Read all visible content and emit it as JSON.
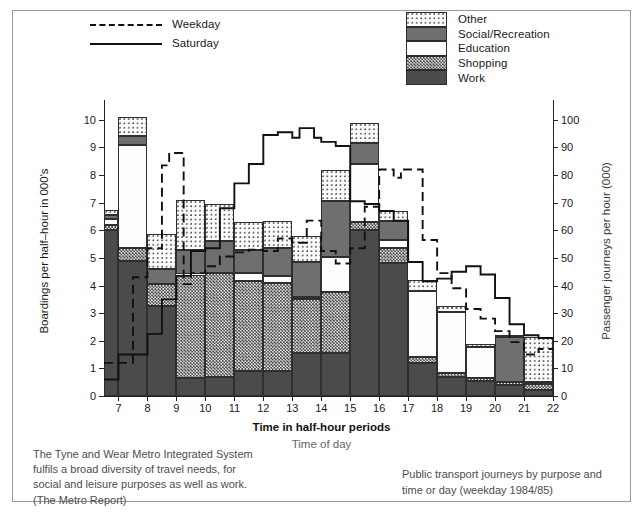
{
  "day_legend": [
    {
      "name": "Weekday",
      "style": "dashed"
    },
    {
      "name": "Saturday",
      "style": "solid"
    }
  ],
  "category_legend": [
    {
      "label": "Other",
      "key": "other"
    },
    {
      "label": "Social/Recreation",
      "key": "social"
    },
    {
      "label": "Education",
      "key": "education"
    },
    {
      "label": "Shopping",
      "key": "shopping"
    },
    {
      "label": "Work",
      "key": "work"
    }
  ],
  "axis_titles": {
    "left": "Boardings per half–hour in 000's",
    "right": "Passenger journeys per hour (000)",
    "x_primary": "Time in half-hour periods",
    "x_secondary": "Time of day"
  },
  "notes": {
    "left": [
      "The Tyne and Wear Metro Integrated System",
      "fulfils a broad diversity of travel needs, for",
      "social and leisure purposes as well as work.",
      "(The Metro Report)"
    ],
    "right": [
      "Public transport journeys by purpose and",
      "time or day (weekday 1984/85)"
    ]
  },
  "colors": {
    "work": "#4b4b4b",
    "shopping": "#eeeeee",
    "education": "#fdfdfd",
    "social": "#6f6f6f",
    "other": "#fbfbfb",
    "line": "#111111",
    "frame": "#9a9a9a"
  },
  "chart_data": {
    "type": "bar",
    "xlabel": "Time in half-hour periods",
    "ylabel": "Boardings per half–hour in 000's",
    "y2label": "Passenger journeys per hour (000)",
    "ylim": [
      0,
      10.5
    ],
    "y2lim": [
      0,
      105
    ],
    "grid": false,
    "legend_position": "top",
    "stacked": true,
    "x_ticks": [
      7,
      8,
      9,
      10,
      11,
      12,
      13,
      14,
      15,
      16,
      17,
      18,
      19,
      20,
      21,
      22
    ],
    "y_ticks": [
      0,
      1,
      2,
      3,
      4,
      5,
      6,
      7,
      8,
      9,
      10
    ],
    "y2_ticks": [
      0,
      10,
      20,
      30,
      40,
      50,
      60,
      70,
      80,
      90,
      100
    ],
    "categories": [
      "6.5-7",
      "7-7.5",
      "7.5-8",
      "8-8.5",
      "8.5-9",
      "9-9.5",
      "9.5-10",
      "10-10.5",
      "10.5-11",
      "11-11.5",
      "11.5-12",
      "12-12.5",
      "12.5-13",
      "13-13.5",
      "13.5-14",
      "14-14.5",
      "14.5-15",
      "15-15.5",
      "15.5-16",
      "16-16.5",
      "16.5-17",
      "17-17.5",
      "17.5-18",
      "18-18.5",
      "18.5-19",
      "19-19.5",
      "19.5-20",
      "20-20.5",
      "20.5-21",
      "21-21.5",
      "21.5-22"
    ],
    "bar_slots": [
      {
        "x0": 6.5,
        "x1": 7.0,
        "work": 6.0,
        "shopping": 0.18,
        "education": 0.22,
        "social": 0.17,
        "other": 0.18
      },
      {
        "x0": 7.0,
        "x1": 8.0,
        "work": 4.9,
        "shopping": 0.45,
        "education": 3.75,
        "social": 0.3,
        "other": 0.7
      },
      {
        "x0": 8.0,
        "x1": 9.0,
        "work": 3.25,
        "shopping": 0.8,
        "education": 0.0,
        "social": 0.55,
        "other": 1.25
      },
      {
        "x0": 9.0,
        "x1": 10.0,
        "work": 0.65,
        "shopping": 3.75,
        "education": 0.0,
        "social": 0.9,
        "other": 1.8
      },
      {
        "x0": 10.0,
        "x1": 11.0,
        "work": 0.7,
        "shopping": 3.75,
        "education": 0.0,
        "social": 1.15,
        "other": 1.35
      },
      {
        "x0": 11.0,
        "x1": 12.0,
        "work": 0.9,
        "shopping": 3.25,
        "education": 0.3,
        "social": 0.85,
        "other": 1.0
      },
      {
        "x0": 12.0,
        "x1": 13.0,
        "work": 0.9,
        "shopping": 3.2,
        "education": 0.25,
        "social": 1.0,
        "other": 1.0
      },
      {
        "x0": 13.0,
        "x1": 14.0,
        "work": 1.55,
        "shopping": 1.95,
        "education": 0.1,
        "social": 1.25,
        "other": 0.95
      },
      {
        "x0": 14.0,
        "x1": 15.0,
        "work": 1.55,
        "shopping": 2.2,
        "education": 1.3,
        "social": 2.0,
        "other": 1.15
      },
      {
        "x0": 15.0,
        "x1": 16.0,
        "work": 6.0,
        "shopping": 0.3,
        "education": 2.1,
        "social": 0.75,
        "other": 0.75
      },
      {
        "x0": 16.0,
        "x1": 17.0,
        "work": 4.8,
        "shopping": 0.55,
        "education": 0.3,
        "social": 0.7,
        "other": 0.35
      },
      {
        "x0": 17.0,
        "x1": 18.0,
        "work": 1.2,
        "shopping": 0.2,
        "education": 2.4,
        "social": 0.0,
        "other": 0.4
      },
      {
        "x0": 18.0,
        "x1": 19.0,
        "work": 0.7,
        "shopping": 0.15,
        "education": 2.2,
        "social": 0.0,
        "other": 0.2
      },
      {
        "x0": 19.0,
        "x1": 20.0,
        "work": 0.55,
        "shopping": 0.12,
        "education": 1.1,
        "social": 0.0,
        "other": 0.1
      },
      {
        "x0": 20.0,
        "x1": 21.0,
        "work": 0.4,
        "shopping": 0.12,
        "education": 0.0,
        "social": 1.6,
        "other": 0.1
      },
      {
        "x0": 21.0,
        "x1": 22.0,
        "work": 0.22,
        "shopping": 0.2,
        "education": 0.0,
        "social": 0.1,
        "other": 1.6
      }
    ],
    "series": [
      {
        "name": "Weekday",
        "style": "dashed",
        "step_points": [
          [
            6.5,
            1.2
          ],
          [
            7.5,
            1.2
          ],
          [
            7.5,
            4.3
          ],
          [
            8.0,
            4.3
          ],
          [
            8.0,
            5.35
          ],
          [
            8.5,
            5.35
          ],
          [
            8.5,
            8.35
          ],
          [
            8.75,
            8.35
          ],
          [
            8.75,
            8.8
          ],
          [
            9.25,
            8.8
          ],
          [
            9.25,
            4.05
          ],
          [
            9.5,
            4.05
          ],
          [
            9.5,
            4.45
          ],
          [
            10.0,
            4.45
          ],
          [
            10.0,
            4.7
          ],
          [
            10.5,
            4.7
          ],
          [
            10.5,
            5.05
          ],
          [
            11.0,
            5.05
          ],
          [
            11.0,
            5.2
          ],
          [
            11.5,
            5.2
          ],
          [
            11.5,
            5.3
          ],
          [
            12.0,
            5.3
          ],
          [
            12.0,
            5.25
          ],
          [
            12.5,
            5.25
          ],
          [
            12.5,
            5.7
          ],
          [
            13.0,
            5.7
          ],
          [
            13.0,
            5.55
          ],
          [
            13.5,
            5.55
          ],
          [
            13.5,
            6.35
          ],
          [
            14.0,
            6.35
          ],
          [
            14.0,
            5.25
          ],
          [
            14.5,
            5.25
          ],
          [
            14.5,
            4.8
          ],
          [
            15.0,
            4.8
          ],
          [
            15.0,
            5.35
          ],
          [
            15.5,
            5.35
          ],
          [
            15.5,
            6.85
          ],
          [
            16.0,
            6.85
          ],
          [
            16.0,
            8.2
          ],
          [
            16.5,
            8.2
          ],
          [
            16.5,
            7.9
          ],
          [
            16.75,
            7.9
          ],
          [
            16.75,
            8.2
          ],
          [
            17.5,
            8.2
          ],
          [
            17.5,
            5.65
          ],
          [
            18.0,
            5.65
          ],
          [
            18.0,
            4.45
          ],
          [
            18.5,
            4.45
          ],
          [
            18.5,
            3.9
          ],
          [
            19.0,
            3.9
          ],
          [
            19.0,
            3.15
          ],
          [
            19.5,
            3.15
          ],
          [
            19.5,
            2.8
          ],
          [
            20.0,
            2.8
          ],
          [
            20.0,
            2.35
          ],
          [
            20.5,
            2.35
          ],
          [
            20.5,
            1.95
          ],
          [
            21.0,
            1.95
          ],
          [
            21.0,
            1.5
          ],
          [
            21.5,
            1.5
          ],
          [
            21.5,
            1.7
          ],
          [
            22.0,
            1.7
          ]
        ]
      },
      {
        "name": "Saturday",
        "style": "solid",
        "step_points": [
          [
            6.5,
            0.6
          ],
          [
            7.0,
            0.6
          ],
          [
            7.0,
            1.5
          ],
          [
            8.0,
            1.5
          ],
          [
            8.0,
            2.25
          ],
          [
            8.5,
            2.25
          ],
          [
            8.5,
            3.5
          ],
          [
            9.0,
            3.5
          ],
          [
            9.0,
            4.35
          ],
          [
            9.5,
            4.35
          ],
          [
            9.5,
            5.25
          ],
          [
            10.0,
            5.25
          ],
          [
            10.0,
            5.35
          ],
          [
            10.5,
            5.35
          ],
          [
            10.5,
            6.8
          ],
          [
            11.0,
            6.8
          ],
          [
            11.0,
            7.7
          ],
          [
            11.5,
            7.7
          ],
          [
            11.5,
            8.4
          ],
          [
            12.0,
            8.4
          ],
          [
            12.0,
            9.45
          ],
          [
            12.5,
            9.45
          ],
          [
            12.5,
            9.55
          ],
          [
            13.0,
            9.55
          ],
          [
            13.0,
            9.35
          ],
          [
            13.25,
            9.35
          ],
          [
            13.25,
            9.7
          ],
          [
            13.75,
            9.7
          ],
          [
            13.75,
            9.35
          ],
          [
            14.0,
            9.35
          ],
          [
            14.0,
            9.2
          ],
          [
            14.5,
            9.2
          ],
          [
            14.5,
            9.05
          ],
          [
            15.0,
            9.05
          ],
          [
            15.0,
            7.05
          ],
          [
            15.5,
            7.05
          ],
          [
            15.5,
            6.95
          ],
          [
            16.0,
            6.95
          ],
          [
            16.0,
            6.7
          ],
          [
            16.5,
            6.7
          ],
          [
            16.5,
            6.35
          ],
          [
            17.0,
            6.35
          ],
          [
            17.0,
            4.85
          ],
          [
            17.5,
            4.85
          ],
          [
            17.5,
            4.15
          ],
          [
            18.0,
            4.15
          ],
          [
            18.0,
            4.25
          ],
          [
            18.5,
            4.25
          ],
          [
            18.5,
            4.5
          ],
          [
            19.0,
            4.5
          ],
          [
            19.0,
            4.7
          ],
          [
            19.5,
            4.7
          ],
          [
            19.5,
            4.4
          ],
          [
            20.0,
            4.4
          ],
          [
            20.0,
            3.55
          ],
          [
            20.5,
            3.55
          ],
          [
            20.5,
            2.6
          ],
          [
            21.0,
            2.6
          ],
          [
            21.0,
            2.2
          ],
          [
            21.5,
            2.2
          ],
          [
            21.5,
            2.1
          ],
          [
            22.0,
            2.1
          ]
        ]
      }
    ]
  }
}
